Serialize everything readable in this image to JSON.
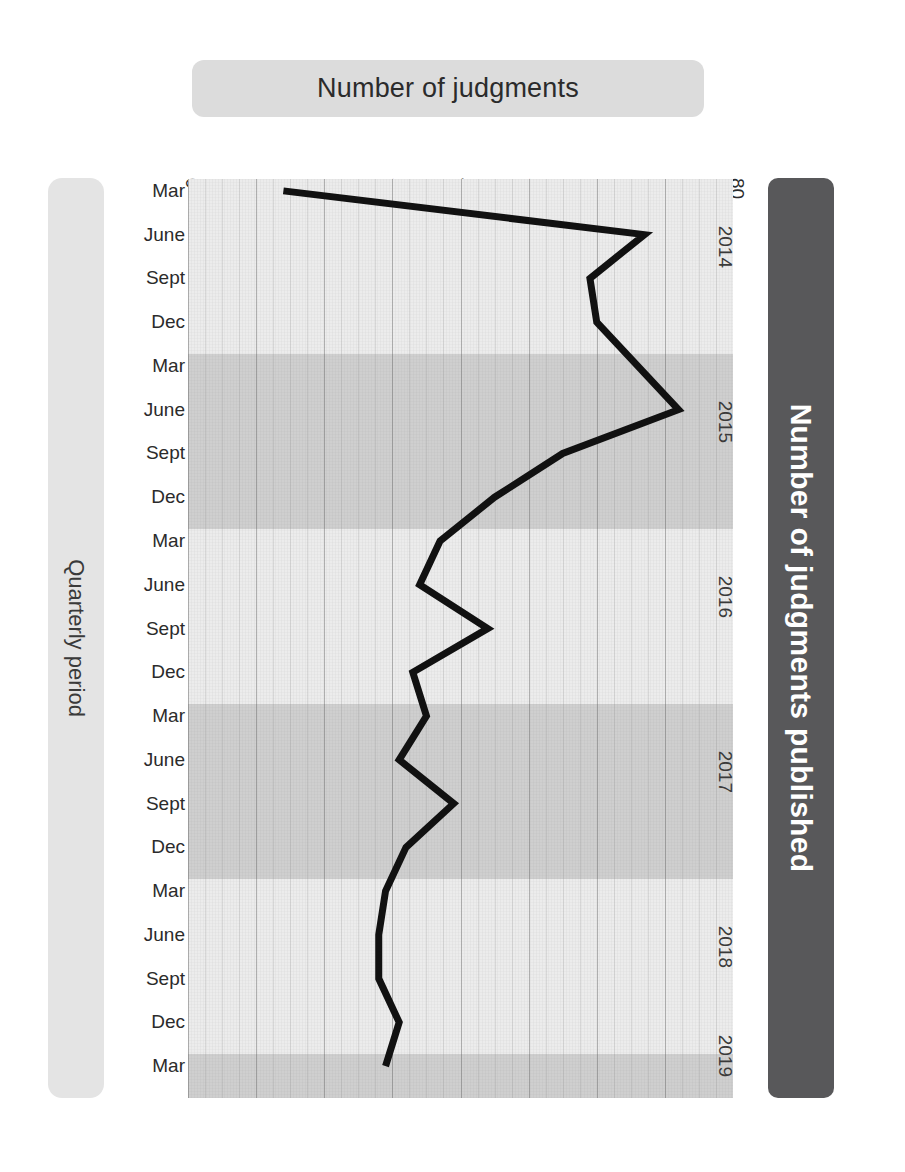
{
  "header": {
    "title": "Number of judgments"
  },
  "axis_label_left": "Quarterly period",
  "panel_right": {
    "label": "Number of judgments published"
  },
  "chart_data": {
    "type": "line",
    "title": "Number of judgments",
    "xlabel": "Number of judgments published",
    "ylabel": "Quarterly period",
    "orientation": "horizontal",
    "xlim": [
      0,
      80
    ],
    "xticks": [
      "0",
      "10",
      "20",
      "30",
      "40",
      "50",
      "60",
      "70",
      "80"
    ],
    "grid": true,
    "legend": false,
    "categories": [
      "Mar",
      "June",
      "Sept",
      "Dec",
      "Mar",
      "June",
      "Sept",
      "Dec",
      "Mar",
      "June",
      "Sept",
      "Dec",
      "Mar",
      "June",
      "Sept",
      "Dec",
      "Mar",
      "June",
      "Sept",
      "Dec",
      "Mar"
    ],
    "year_groups": [
      {
        "year": "2014",
        "start_index": 0,
        "count": 4,
        "shade": "light"
      },
      {
        "year": "2015",
        "start_index": 4,
        "count": 4,
        "shade": "dark"
      },
      {
        "year": "2016",
        "start_index": 8,
        "count": 4,
        "shade": "light"
      },
      {
        "year": "2017",
        "start_index": 12,
        "count": 4,
        "shade": "dark"
      },
      {
        "year": "2018",
        "start_index": 16,
        "count": 4,
        "shade": "light"
      },
      {
        "year": "2019",
        "start_index": 20,
        "count": 1,
        "shade": "dark"
      }
    ],
    "values": [
      14,
      67,
      59,
      60,
      66,
      72,
      55,
      45,
      37,
      34,
      44,
      33,
      35,
      31,
      39,
      32,
      29,
      28,
      28,
      31,
      29
    ],
    "points": [
      {
        "period": "Mar",
        "year": "2014",
        "value": 14
      },
      {
        "period": "June",
        "year": "2014",
        "value": 67
      },
      {
        "period": "Sept",
        "year": "2014",
        "value": 59
      },
      {
        "period": "Dec",
        "year": "2014",
        "value": 60
      },
      {
        "period": "Mar",
        "year": "2015",
        "value": 66
      },
      {
        "period": "June",
        "year": "2015",
        "value": 72
      },
      {
        "period": "Sept",
        "year": "2015",
        "value": 55
      },
      {
        "period": "Dec",
        "year": "2015",
        "value": 45
      },
      {
        "period": "Mar",
        "year": "2016",
        "value": 37
      },
      {
        "period": "June",
        "year": "2016",
        "value": 34
      },
      {
        "period": "Sept",
        "year": "2016",
        "value": 44
      },
      {
        "period": "Dec",
        "year": "2016",
        "value": 33
      },
      {
        "period": "Mar",
        "year": "2017",
        "value": 35
      },
      {
        "period": "June",
        "year": "2017",
        "value": 31
      },
      {
        "period": "Sept",
        "year": "2017",
        "value": 39
      },
      {
        "period": "Dec",
        "year": "2017",
        "value": 32
      },
      {
        "period": "Mar",
        "year": "2018",
        "value": 29
      },
      {
        "period": "June",
        "year": "2018",
        "value": 28
      },
      {
        "period": "Sept",
        "year": "2018",
        "value": 28
      },
      {
        "period": "Dec",
        "year": "2018",
        "value": 31
      },
      {
        "period": "Mar",
        "year": "2019",
        "value": 29
      }
    ],
    "colors": {
      "line": "#111111",
      "band_light": "#ececec",
      "band_dark": "#cfcfcf",
      "title_pill": "#dcdcdc",
      "left_pill": "#e4e4e4",
      "right_panel": "#58585a"
    }
  }
}
